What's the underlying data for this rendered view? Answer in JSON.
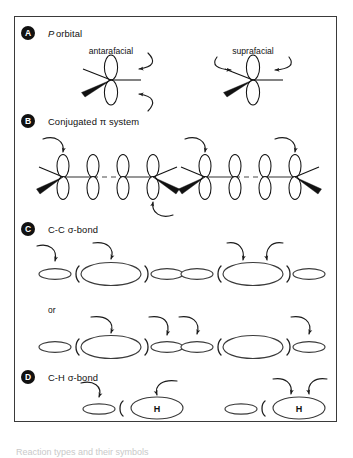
{
  "figure": {
    "background_color": "#ffffff",
    "frame_color": "#3a3a3a",
    "ink_color": "#111111",
    "sections": [
      {
        "badge": "A",
        "title": "P orbital",
        "title_italic_prefix": "P",
        "title_rest": " orbital",
        "panels": [
          {
            "label": "antarafacial",
            "mode": "antarafacial",
            "arrows": [
              "into-top-lobe-from-upper-right",
              "into-bottom-lobe-from-lower-right"
            ]
          },
          {
            "label": "suprafacial",
            "mode": "suprafacial",
            "arrows": [
              "into-top-lobe-from-upper-left",
              "into-top-lobe-from-upper-right"
            ]
          }
        ]
      },
      {
        "badge": "B",
        "title": "Conjugated π system",
        "panels": [
          {
            "label": "",
            "mode": "antarafacial",
            "orbital_count": 4,
            "bond_pattern": [
              "solid",
              "dashed",
              "solid"
            ],
            "arrows": [
              "into-orbital1-top-lobe",
              "into-orbital4-bottom-lobe"
            ]
          },
          {
            "label": "",
            "mode": "suprafacial",
            "orbital_count": 4,
            "bond_pattern": [
              "solid",
              "dashed",
              "solid"
            ],
            "arrows": [
              "into-orbital1-top-lobe",
              "into-orbital4-top-lobe"
            ]
          }
        ]
      },
      {
        "badge": "C",
        "title": "C-C σ-bond",
        "or_label": "or",
        "rows": [
          {
            "panels": [
              {
                "arrows": [
                  "into-left-small-ellipse",
                  "into-center-large-ellipse"
                ]
              },
              {
                "arrows": [
                  "into-center-large-ellipse-left",
                  "into-center-large-ellipse-right"
                ]
              }
            ]
          },
          {
            "panels": [
              {
                "arrows": [
                  "into-center-large-ellipse",
                  "into-right-small-ellipse"
                ]
              },
              {
                "arrows": [
                  "into-left-small-ellipse",
                  "into-right-small-ellipse"
                ]
              }
            ]
          }
        ]
      },
      {
        "badge": "D",
        "title": "C-H σ-bond",
        "atom_label": "H",
        "panels": [
          {
            "arrows": [
              "into-left-small-ellipse",
              "into-H-ellipse"
            ]
          },
          {
            "arrows": [
              "into-H-ellipse-left",
              "into-H-ellipse-right"
            ]
          }
        ]
      }
    ]
  },
  "caption": {
    "ghost_text": "Reaction types and their symbols"
  }
}
